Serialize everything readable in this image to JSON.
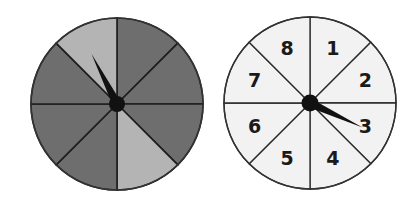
{
  "spinners": [
    {
      "name": "shaded-spinner",
      "sections": 8,
      "center": [
        117,
        104
      ],
      "radius": 86,
      "colors": {
        "dark": "#6e6e6e",
        "light": "#b4b4b4",
        "line": "#1e1e1e"
      },
      "section_shades": [
        "dark",
        "dark",
        "dark",
        "light",
        "dark",
        "dark",
        "dark",
        "light"
      ],
      "pointer_angle_deg": -27
    },
    {
      "name": "numbered-spinner",
      "sections": 8,
      "center": [
        310,
        103
      ],
      "radius": 86,
      "colors": {
        "fill": "#f2f2f2",
        "line": "#2a2a2a"
      },
      "labels": [
        "1",
        "2",
        "3",
        "4",
        "5",
        "6",
        "7",
        "8"
      ],
      "pointer_angle_deg": 25
    }
  ]
}
